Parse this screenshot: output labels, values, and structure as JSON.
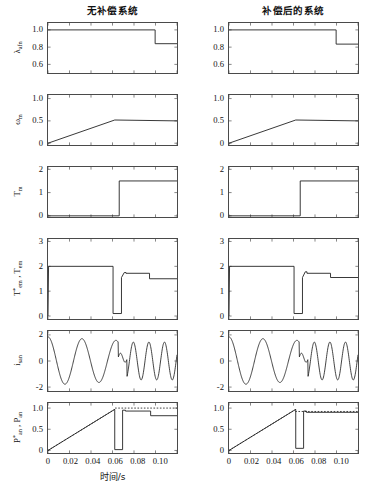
{
  "figure": {
    "titles": {
      "left": "无补偿系统",
      "right": "补偿后的系统"
    },
    "xlabel": "时间/s",
    "xticks": [
      "0",
      "0.02",
      "0.04",
      "0.06",
      "0.08",
      "0.10"
    ],
    "xlim": [
      0,
      0.115
    ]
  },
  "rows": [
    {
      "key": "lambda",
      "ylabel_html": "λ<sub>afn</sub>",
      "yticks": [
        "1.0",
        "0.8",
        "0.6"
      ],
      "ytickvals": [
        1.0,
        0.8,
        0.6
      ],
      "ylim": [
        0.5,
        1.08
      ]
    },
    {
      "key": "omega",
      "ylabel_html": "ω<sub>m</sub>",
      "yticks": [
        "1.0",
        "0.5",
        "0"
      ],
      "ytickvals": [
        1.0,
        0.5,
        0.0
      ],
      "ylim": [
        -0.04,
        1.08
      ]
    },
    {
      "key": "Tm",
      "ylabel_html": "T<sub>m</sub>",
      "yticks": [
        "2",
        "1",
        "0"
      ],
      "ytickvals": [
        2,
        1,
        0
      ],
      "ylim": [
        -0.05,
        2.1
      ]
    },
    {
      "key": "Tem",
      "ylabel_html": "T<sup>*</sup><sub>em</sub> , T<sub>em</sub>",
      "yticks": [
        "3",
        "2",
        "1",
        "0"
      ],
      "ytickvals": [
        3,
        2,
        1,
        0
      ],
      "ylim": [
        -0.12,
        3.1
      ]
    },
    {
      "key": "isan",
      "ylabel_html": "i<sub>san</sub>",
      "yticks": [
        "2",
        "0",
        "-2"
      ],
      "ytickvals": [
        2,
        0,
        -2
      ],
      "ylim": [
        -2.3,
        2.3
      ]
    },
    {
      "key": "Pan",
      "ylabel_html": "P<sup>*</sup><sub>an</sub> , P<sub>an</sub>",
      "yticks": [
        "1.0",
        "0.5",
        "0"
      ],
      "ytickvals": [
        1.0,
        0.5,
        0.0
      ],
      "ylim": [
        -0.06,
        1.12
      ]
    }
  ],
  "chart_data": [
    {
      "id": "left-lambda",
      "type": "line",
      "title": "无补偿系统",
      "ylabel": "λ_afn",
      "xlabel": "时间/s",
      "xlim": [
        0,
        0.115
      ],
      "ylim": [
        0.5,
        1.08
      ],
      "series": [
        {
          "name": "lambda_afn",
          "x": [
            0,
            0.0955,
            0.0955,
            0.115
          ],
          "y": [
            1.0,
            1.0,
            0.84,
            0.84
          ]
        }
      ]
    },
    {
      "id": "right-lambda",
      "type": "line",
      "title": "补偿后的系统",
      "ylabel": "λ_afn",
      "xlabel": "时间/s",
      "xlim": [
        0,
        0.115
      ],
      "ylim": [
        0.5,
        1.08
      ],
      "series": [
        {
          "name": "lambda_afn",
          "x": [
            0,
            0.0955,
            0.0955,
            0.115
          ],
          "y": [
            1.0,
            1.0,
            0.835,
            0.835
          ]
        }
      ]
    },
    {
      "id": "left-omega",
      "type": "line",
      "ylabel": "ω_m",
      "xlabel": "时间/s",
      "xlim": [
        0,
        0.115
      ],
      "ylim": [
        -0.04,
        1.08
      ],
      "series": [
        {
          "name": "omega_m",
          "x": [
            0,
            0.0595,
            0.115
          ],
          "y": [
            0.0,
            0.52,
            0.5
          ]
        }
      ]
    },
    {
      "id": "right-omega",
      "type": "line",
      "ylabel": "ω_m",
      "xlabel": "时间/s",
      "xlim": [
        0,
        0.115
      ],
      "ylim": [
        -0.04,
        1.08
      ],
      "series": [
        {
          "name": "omega_m",
          "x": [
            0,
            0.0595,
            0.115
          ],
          "y": [
            0.0,
            0.52,
            0.5
          ]
        }
      ]
    },
    {
      "id": "left-Tm",
      "type": "line",
      "ylabel": "T_m",
      "xlabel": "时间/s",
      "xlim": [
        0,
        0.115
      ],
      "ylim": [
        -0.05,
        2.1
      ],
      "series": [
        {
          "name": "T_m",
          "x": [
            0,
            0.0635,
            0.0635,
            0.115
          ],
          "y": [
            0.0,
            0.0,
            1.5,
            1.5
          ]
        }
      ]
    },
    {
      "id": "right-Tm",
      "type": "line",
      "ylabel": "T_m",
      "xlabel": "时间/s",
      "xlim": [
        0,
        0.115
      ],
      "ylim": [
        -0.05,
        2.1
      ],
      "series": [
        {
          "name": "T_m",
          "x": [
            0,
            0.0635,
            0.0635,
            0.115
          ],
          "y": [
            0.0,
            0.0,
            1.5,
            1.5
          ]
        }
      ]
    },
    {
      "id": "left-Tem",
      "type": "line",
      "ylabel": "T*_em , T_em",
      "xlabel": "时间/s",
      "xlim": [
        0,
        0.115
      ],
      "ylim": [
        -0.12,
        3.1
      ],
      "series": [
        {
          "name": "T_em",
          "x": [
            0,
            0.0005,
            0.058,
            0.058,
            0.0655,
            0.0655,
            0.068,
            0.0695,
            0.0695,
            0.0905,
            0.0905,
            0.115
          ],
          "y": [
            0.0,
            2.0,
            2.0,
            0.1,
            0.1,
            1.55,
            1.75,
            1.75,
            1.72,
            1.72,
            1.5,
            1.5
          ]
        }
      ]
    },
    {
      "id": "right-Tem",
      "type": "line",
      "ylabel": "T*_em , T_em",
      "xlabel": "时间/s",
      "xlim": [
        0,
        0.115
      ],
      "ylim": [
        -0.12,
        3.1
      ],
      "series": [
        {
          "name": "T_em",
          "x": [
            0,
            0.0005,
            0.058,
            0.058,
            0.0655,
            0.0655,
            0.068,
            0.0695,
            0.0695,
            0.0905,
            0.0905,
            0.115
          ],
          "y": [
            0.0,
            2.0,
            2.0,
            0.1,
            0.1,
            1.55,
            1.78,
            1.78,
            1.72,
            1.72,
            1.55,
            1.55
          ]
        }
      ]
    },
    {
      "id": "left-isan",
      "type": "line",
      "ylabel": "i_san",
      "xlabel": "时间/s",
      "xlim": [
        0,
        0.115
      ],
      "ylim": [
        -2.3,
        2.3
      ],
      "note": "damped sinusoid, frequency increases after the 0.063 s load step"
    },
    {
      "id": "right-isan",
      "type": "line",
      "ylabel": "i_san",
      "xlabel": "时间/s",
      "xlim": [
        0,
        0.115
      ],
      "ylim": [
        -2.3,
        2.3
      ],
      "note": "damped sinusoid, frequency increases after the 0.063 s load step"
    },
    {
      "id": "left-Pan",
      "type": "line",
      "ylabel": "P*_an , P_an",
      "xlabel": "时间/s",
      "xlim": [
        0,
        0.115
      ],
      "ylim": [
        -0.06,
        1.12
      ],
      "series": [
        {
          "name": "P_an",
          "x": [
            0,
            0.0595,
            0.0595,
            0.0665,
            0.0665,
            0.069,
            0.069,
            0.0915,
            0.0915,
            0.115
          ],
          "y": [
            0.0,
            0.97,
            0.02,
            0.02,
            0.95,
            0.95,
            0.93,
            0.93,
            0.82,
            0.82
          ]
        },
        {
          "name": "P*_an (reference, dotted)",
          "x": [
            0,
            0.0595,
            0.0595,
            0.115
          ],
          "y": [
            0.0,
            0.97,
            1.0,
            1.0
          ]
        }
      ]
    },
    {
      "id": "right-Pan",
      "type": "line",
      "ylabel": "P*_an , P_an",
      "xlabel": "时间/s",
      "xlim": [
        0,
        0.115
      ],
      "ylim": [
        -0.06,
        1.12
      ],
      "series": [
        {
          "name": "P_an",
          "x": [
            0,
            0.0595,
            0.0595,
            0.0665,
            0.0665,
            0.069,
            0.069,
            0.115
          ],
          "y": [
            0.0,
            0.97,
            0.05,
            0.05,
            0.93,
            0.93,
            0.9,
            0.9
          ]
        },
        {
          "name": "P*_an (reference, dotted)",
          "x": [
            0,
            0.0595,
            0.0595,
            0.115
          ],
          "y": [
            0.0,
            0.97,
            0.92,
            0.92
          ]
        }
      ]
    }
  ]
}
